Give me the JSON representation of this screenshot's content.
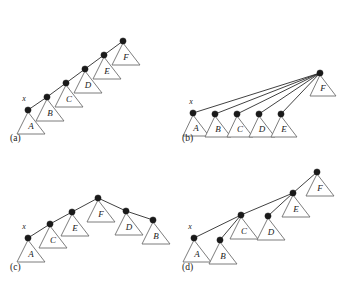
{
  "figure": {
    "width": 345,
    "height": 287,
    "background": "#ffffff",
    "node_color": "#1a1a1a",
    "edge_color": "#2b2b2b",
    "triangle_stroke": "#6e6e6e",
    "triangle_fill": "#ffffff",
    "pointer_label": "x"
  },
  "panels": [
    {
      "id": "a",
      "label": "(a)",
      "label_pos": {
        "x": 10,
        "y": 141
      },
      "pointer": {
        "label": "x",
        "x": 24,
        "y": 101
      },
      "nodes": [
        {
          "name": "node-x",
          "x": 28,
          "y": 110
        },
        {
          "name": "node-b",
          "x": 47,
          "y": 97
        },
        {
          "name": "node-c",
          "x": 66,
          "y": 83
        },
        {
          "name": "node-d",
          "x": 85,
          "y": 69
        },
        {
          "name": "node-e",
          "x": 104,
          "y": 55
        },
        {
          "name": "node-f",
          "x": 123,
          "y": 41
        }
      ],
      "edges": [
        {
          "from": 0,
          "to": 1
        },
        {
          "from": 1,
          "to": 2
        },
        {
          "from": 2,
          "to": 3
        },
        {
          "from": 3,
          "to": 4
        },
        {
          "from": 4,
          "to": 5
        }
      ],
      "subtrees": [
        {
          "label": "A",
          "apex_node": 0,
          "apex_x": 28,
          "apex_y": 112,
          "half_width": 14,
          "height": 22
        },
        {
          "label": "B",
          "apex_node": 1,
          "apex_x": 47,
          "apex_y": 99,
          "half_width": 14,
          "height": 22
        },
        {
          "label": "C",
          "apex_node": 2,
          "apex_x": 66,
          "apex_y": 85,
          "half_width": 14,
          "height": 22
        },
        {
          "label": "D",
          "apex_node": 3,
          "apex_x": 85,
          "apex_y": 71,
          "half_width": 14,
          "height": 22
        },
        {
          "label": "E",
          "apex_node": 4,
          "apex_x": 104,
          "apex_y": 57,
          "half_width": 14,
          "height": 22
        },
        {
          "label": "F",
          "apex_node": 5,
          "apex_x": 123,
          "apex_y": 43,
          "half_width": 14,
          "height": 22
        }
      ],
      "subtree_offsets": [
        {
          "dx": 0,
          "dy": 0
        },
        {
          "dx": 0,
          "dy": 0
        },
        {
          "dx": 0,
          "dy": 0
        },
        {
          "dx": 0,
          "dy": 0
        },
        {
          "dx": 0,
          "dy": 0
        },
        {
          "dx": 0,
          "dy": 0
        }
      ]
    },
    {
      "id": "b",
      "label": "(b)",
      "label_pos": {
        "x": 182,
        "y": 141
      },
      "pointer": {
        "label": "x",
        "x": 191,
        "y": 104
      },
      "nodes": [
        {
          "name": "node-x",
          "x": 193,
          "y": 113
        },
        {
          "name": "node-b",
          "x": 215,
          "y": 114
        },
        {
          "name": "node-c",
          "x": 237,
          "y": 114
        },
        {
          "name": "node-d",
          "x": 259,
          "y": 114
        },
        {
          "name": "node-e",
          "x": 281,
          "y": 114
        },
        {
          "name": "node-f",
          "x": 320,
          "y": 73
        }
      ],
      "edges": [
        {
          "from": 0,
          "to": 5
        },
        {
          "from": 1,
          "to": 5
        },
        {
          "from": 2,
          "to": 5
        },
        {
          "from": 3,
          "to": 5
        },
        {
          "from": 4,
          "to": 5
        }
      ],
      "subtrees": [
        {
          "label": "A",
          "apex_x": 193,
          "apex_y": 115,
          "half_width": 13,
          "height": 21
        },
        {
          "label": "B",
          "apex_x": 215,
          "apex_y": 116,
          "half_width": 13,
          "height": 21
        },
        {
          "label": "C",
          "apex_x": 237,
          "apex_y": 116,
          "half_width": 13,
          "height": 21
        },
        {
          "label": "D",
          "apex_x": 259,
          "apex_y": 116,
          "half_width": 13,
          "height": 21
        },
        {
          "label": "E",
          "apex_x": 281,
          "apex_y": 116,
          "half_width": 13,
          "height": 21
        },
        {
          "label": "F",
          "apex_x": 320,
          "apex_y": 75,
          "half_width": 13,
          "height": 21
        }
      ]
    },
    {
      "id": "c",
      "label": "(c)",
      "label_pos": {
        "x": 10,
        "y": 270
      },
      "pointer": {
        "label": "x",
        "x": 24,
        "y": 229
      },
      "nodes": [
        {
          "name": "node-x",
          "x": 28,
          "y": 238
        },
        {
          "name": "node-c",
          "x": 50,
          "y": 224
        },
        {
          "name": "node-e",
          "x": 72,
          "y": 212
        },
        {
          "name": "node-f",
          "x": 98,
          "y": 198
        },
        {
          "name": "node-d",
          "x": 126,
          "y": 211
        },
        {
          "name": "node-b",
          "x": 153,
          "y": 220
        }
      ],
      "edges": [
        {
          "from": 0,
          "to": 1
        },
        {
          "from": 1,
          "to": 2
        },
        {
          "from": 2,
          "to": 3
        },
        {
          "from": 3,
          "to": 4
        },
        {
          "from": 4,
          "to": 5
        }
      ],
      "subtrees": [
        {
          "label": "A",
          "apex_x": 28,
          "apex_y": 240,
          "half_width": 14,
          "height": 22
        },
        {
          "label": "C",
          "apex_x": 50,
          "apex_y": 226,
          "half_width": 14,
          "height": 22
        },
        {
          "label": "E",
          "apex_x": 72,
          "apex_y": 214,
          "half_width": 14,
          "height": 22
        },
        {
          "label": "F",
          "apex_x": 98,
          "apex_y": 200,
          "half_width": 14,
          "height": 22
        },
        {
          "label": "D",
          "apex_x": 126,
          "apex_y": 213,
          "half_width": 14,
          "height": 22
        },
        {
          "label": "B",
          "apex_x": 153,
          "apex_y": 222,
          "half_width": 14,
          "height": 22
        }
      ]
    },
    {
      "id": "d",
      "label": "(d)",
      "label_pos": {
        "x": 182,
        "y": 270
      },
      "pointer": {
        "label": "x",
        "x": 190,
        "y": 229
      },
      "nodes": [
        {
          "name": "node-x",
          "x": 194,
          "y": 238
        },
        {
          "name": "node-b",
          "x": 220,
          "y": 240
        },
        {
          "name": "node-c",
          "x": 241,
          "y": 215
        },
        {
          "name": "node-d",
          "x": 268,
          "y": 216
        },
        {
          "name": "node-e",
          "x": 293,
          "y": 193
        },
        {
          "name": "node-f",
          "x": 317,
          "y": 172
        }
      ],
      "edges": [
        {
          "from": 0,
          "to": 2
        },
        {
          "from": 1,
          "to": 2
        },
        {
          "from": 2,
          "to": 4
        },
        {
          "from": 3,
          "to": 4
        },
        {
          "from": 4,
          "to": 5
        }
      ],
      "subtrees": [
        {
          "label": "A",
          "apex_x": 194,
          "apex_y": 240,
          "half_width": 14,
          "height": 22
        },
        {
          "label": "B",
          "apex_x": 220,
          "apex_y": 242,
          "half_width": 14,
          "height": 22
        },
        {
          "label": "C",
          "apex_x": 241,
          "apex_y": 217,
          "half_width": 14,
          "height": 22
        },
        {
          "label": "D",
          "apex_x": 268,
          "apex_y": 218,
          "half_width": 14,
          "height": 22
        },
        {
          "label": "E",
          "apex_x": 293,
          "apex_y": 195,
          "half_width": 14,
          "height": 22
        },
        {
          "label": "F",
          "apex_x": 317,
          "apex_y": 174,
          "half_width": 14,
          "height": 22
        }
      ]
    }
  ]
}
